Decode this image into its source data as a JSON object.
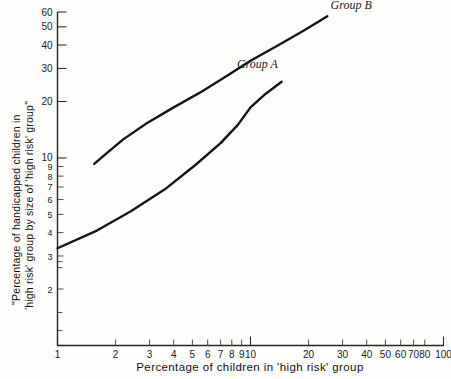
{
  "chart_data": {
    "type": "line",
    "title": "",
    "xlabel": "Percentage of children in 'high risk' group",
    "ylabel_line1": "\"Percentage of handicapped children in",
    "ylabel_line2": "'high risk' group by size of 'high risk' group\"",
    "xscale": "log",
    "yscale": "log",
    "xlim": [
      1,
      100
    ],
    "ylim": [
      1,
      60
    ],
    "grid": false,
    "legend_position": "inline-annotation",
    "x_tick_labels": [
      "1",
      "2",
      "3",
      "4",
      "5",
      "6",
      "7",
      "8",
      "9",
      "10",
      "20",
      "30",
      "40",
      "50",
      "60",
      "70",
      "80",
      "100"
    ],
    "x_tick_values": [
      1,
      2,
      3,
      4,
      5,
      6,
      7,
      8,
      9,
      10,
      20,
      30,
      40,
      50,
      60,
      70,
      80,
      100
    ],
    "y_tick_labels": [
      "1",
      "2",
      "3",
      "4",
      "5",
      "6",
      "7",
      "8",
      "9",
      "10",
      "20",
      "30",
      "40",
      "50",
      "60"
    ],
    "y_tick_values": [
      1,
      2,
      3,
      4,
      5,
      6,
      7,
      8,
      9,
      10,
      20,
      30,
      40,
      50,
      60
    ],
    "series": [
      {
        "name": "Group A",
        "label": "Group A",
        "label_x": 8.5,
        "label_y": 30,
        "x": [
          1.0,
          1.6,
          2.4,
          3.6,
          5.2,
          7.0,
          8.6,
          10.0,
          12.0,
          14.5
        ],
        "y": [
          3.3,
          4.1,
          5.2,
          6.8,
          9.2,
          12.0,
          15.0,
          18.6,
          22.0,
          25.5
        ]
      },
      {
        "name": "Group B",
        "label": "Group B",
        "label_x": 26,
        "label_y": 62,
        "x": [
          1.55,
          1.8,
          2.2,
          2.9,
          4.0,
          5.6,
          7.6,
          10.0,
          14.0,
          19.0,
          25.0
        ],
        "y": [
          9.3,
          10.6,
          12.6,
          15.3,
          18.6,
          22.6,
          27.5,
          33.0,
          40.0,
          48.0,
          57.0
        ]
      }
    ]
  },
  "colors": {
    "background": "#fdfdfb",
    "axis": "#262626",
    "curve": "#141414",
    "text": "#1b1b1b"
  }
}
